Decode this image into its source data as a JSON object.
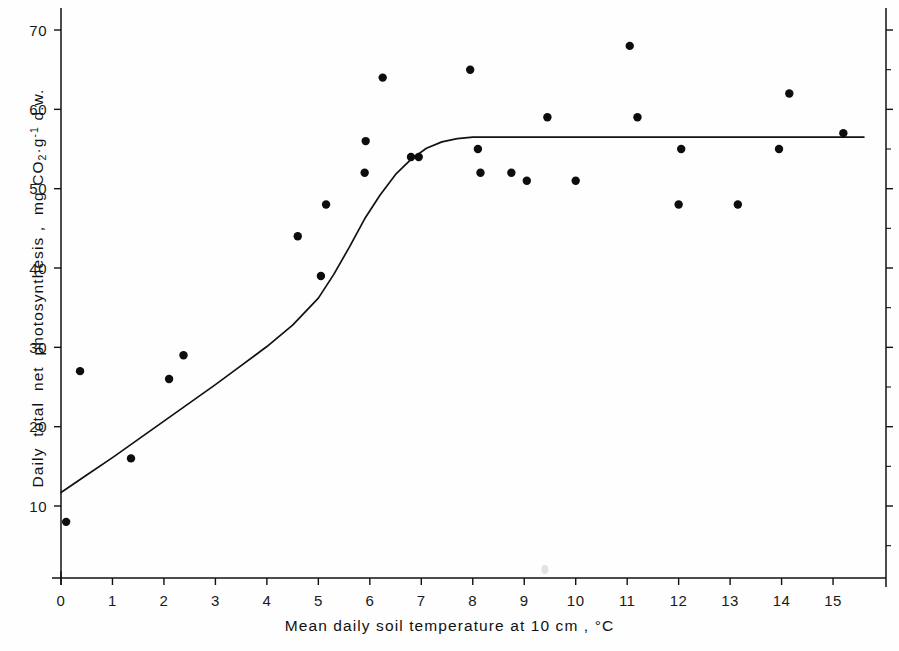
{
  "figure": {
    "background_color": "#fefefe",
    "ink_color": "#111111",
    "point_color": "#0d0d0d"
  },
  "labels": {
    "xlabel_parts": [
      "Mean",
      "daily",
      "soil",
      "temperature",
      "at",
      "10 cm",
      ",",
      "°C"
    ],
    "xlabel_full": "Mean daily soil temperature at 10 cm , °C",
    "ylabel_part1": "Daily  total  net  photosynthesis ,  mg CO",
    "ylabel_sub": "2",
    "ylabel_mid": "·g",
    "ylabel_sup": "-1",
    "ylabel_end": "d.w.",
    "ylabel_full": "Daily total net photosynthesis , mg CO2·g-1 d.w."
  },
  "chart_data": {
    "type": "scatter",
    "title": "",
    "xlabel": "Mean daily soil temperature at 10 cm , °C",
    "ylabel": "Daily total net photosynthesis , mg CO2 g-1 d.w.",
    "xlim": [
      -0.2,
      15.85
    ],
    "ylim": [
      0,
      73
    ],
    "xticks": [
      0,
      1,
      2,
      3,
      4,
      5,
      6,
      7,
      8,
      9,
      10,
      11,
      12,
      13,
      14,
      15
    ],
    "xtick_labels": [
      "0",
      "1",
      "2",
      "3",
      "4",
      "5",
      "6",
      "7",
      "8",
      "9",
      "10",
      "11",
      "12",
      "13",
      "14",
      "15"
    ],
    "yticks": [
      10,
      20,
      30,
      40,
      50,
      60,
      70
    ],
    "ytick_labels": [
      "10",
      "20",
      "30",
      "40",
      "50",
      "60",
      "70"
    ],
    "grid": false,
    "legend": null,
    "series": [
      {
        "name": "Observations",
        "marker": "filled-circle",
        "points": [
          [
            0.1,
            8
          ],
          [
            0.37,
            27
          ],
          [
            1.36,
            16
          ],
          [
            2.1,
            26
          ],
          [
            2.38,
            29
          ],
          [
            4.6,
            44
          ],
          [
            5.05,
            39
          ],
          [
            5.15,
            48
          ],
          [
            5.9,
            52
          ],
          [
            5.92,
            56
          ],
          [
            6.25,
            64
          ],
          [
            6.8,
            54
          ],
          [
            6.95,
            54
          ],
          [
            7.95,
            65
          ],
          [
            8.1,
            55
          ],
          [
            8.15,
            52
          ],
          [
            8.75,
            52
          ],
          [
            9.05,
            51
          ],
          [
            9.45,
            59
          ],
          [
            10.0,
            51
          ],
          [
            11.05,
            68
          ],
          [
            11.2,
            59
          ],
          [
            12.0,
            48
          ],
          [
            12.05,
            55
          ],
          [
            13.15,
            48
          ],
          [
            13.95,
            55
          ],
          [
            14.15,
            62
          ],
          [
            15.2,
            57
          ]
        ]
      },
      {
        "name": "Fitted response curve",
        "marker": "line",
        "description": "Linear rise then saturating plateau at approximately 56.5",
        "plateau_value": 56.5,
        "intercept_at_x0": 11.7,
        "breakpoint_x": 7.0,
        "points": [
          [
            0.0,
            11.7
          ],
          [
            0.5,
            13.9
          ],
          [
            1.0,
            16.1
          ],
          [
            1.5,
            18.4
          ],
          [
            2.0,
            20.7
          ],
          [
            2.5,
            23.0
          ],
          [
            3.0,
            25.3
          ],
          [
            3.5,
            27.7
          ],
          [
            4.0,
            30.1
          ],
          [
            4.5,
            32.8
          ],
          [
            5.0,
            36.2
          ],
          [
            5.3,
            39.2
          ],
          [
            5.6,
            42.6
          ],
          [
            5.9,
            46.2
          ],
          [
            6.2,
            49.2
          ],
          [
            6.5,
            51.8
          ],
          [
            6.8,
            53.7
          ],
          [
            7.1,
            55.1
          ],
          [
            7.4,
            55.9
          ],
          [
            7.7,
            56.3
          ],
          [
            8.0,
            56.5
          ],
          [
            9.0,
            56.5
          ],
          [
            10.0,
            56.5
          ],
          [
            11.0,
            56.5
          ],
          [
            12.0,
            56.5
          ],
          [
            13.0,
            56.5
          ],
          [
            14.0,
            56.5
          ],
          [
            15.0,
            56.5
          ],
          [
            15.6,
            56.5
          ]
        ]
      }
    ],
    "artifact": {
      "x": 9.4,
      "y": 2.0,
      "note": "faint scan speck"
    }
  }
}
